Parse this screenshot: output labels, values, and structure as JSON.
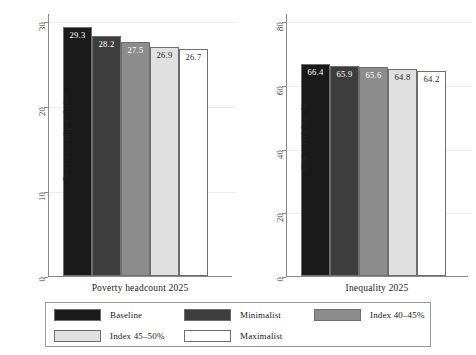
{
  "chart_data": {
    "type": "bar",
    "title": "",
    "panels": [
      {
        "name": "poverty-panel",
        "xlabel": "Poverty headcount 2025",
        "ylabel": "Percentage of population",
        "ylim": [
          0,
          30
        ],
        "yticks": [
          0,
          10,
          20,
          30
        ],
        "ytick_labels": [
          "0",
          "10",
          "20",
          "30"
        ],
        "categories": [
          "Baseline",
          "Minimalist",
          "Index 40–45%",
          "Index 45–50%",
          "Maximalist"
        ],
        "values": [
          29.3,
          28.2,
          27.5,
          26.9,
          26.7
        ],
        "value_labels": [
          "29.3",
          "28.2",
          "27.5",
          "26.9",
          "26.7"
        ],
        "grid": true,
        "legend_position": "bottom"
      },
      {
        "name": "inequality-panel",
        "xlabel": "Inequality 2025",
        "ylabel": "Gini coefficient, %",
        "ylim": [
          0,
          80
        ],
        "yticks": [
          0,
          20,
          40,
          60,
          80
        ],
        "ytick_labels": [
          "0",
          "20",
          "40",
          "60",
          "80"
        ],
        "categories": [
          "Baseline",
          "Minimalist",
          "Index 40–45%",
          "Index 45–50%",
          "Maximalist"
        ],
        "values": [
          66.4,
          65.9,
          65.6,
          64.8,
          64.2
        ],
        "value_labels": [
          "66.4",
          "65.9",
          "65.6",
          "64.8",
          "64.2"
        ],
        "grid": true,
        "legend_position": "bottom"
      }
    ],
    "series_colors": [
      "#1a1a1a",
      "#3d3d3d",
      "#8c8c8c",
      "#e0e0e0",
      "#ffffff"
    ],
    "legend": {
      "entries": [
        {
          "label": "Baseline",
          "color": "#1a1a1a"
        },
        {
          "label": "Minimalist",
          "color": "#3d3d3d"
        },
        {
          "label": "Index 40–45%",
          "color": "#8c8c8c"
        },
        {
          "label": "Index 45–50%",
          "color": "#e0e0e0"
        },
        {
          "label": "Maximalist",
          "color": "#ffffff"
        }
      ]
    }
  }
}
